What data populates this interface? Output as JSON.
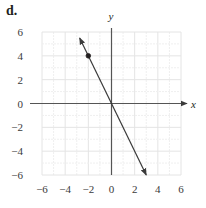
{
  "panel_label": "d.",
  "chart_data": {
    "type": "line",
    "title": "",
    "xlabel": "x",
    "ylabel": "y",
    "xlim": [
      -6,
      6
    ],
    "ylim": [
      -6,
      6
    ],
    "grid": true,
    "grid_minor_step": 1,
    "grid_major_step": 2,
    "x_ticks": [
      -6,
      -4,
      -2,
      0,
      2,
      4,
      6
    ],
    "y_ticks": [
      -6,
      -4,
      -2,
      0,
      2,
      4,
      6
    ],
    "x_tick_labels": [
      "−6",
      "−4",
      "−2",
      "0",
      "2",
      "4",
      "6"
    ],
    "y_tick_labels": [
      "−6",
      "−4",
      "−2",
      "0",
      "2",
      "4",
      "6"
    ],
    "series": [
      {
        "name": "line",
        "equation": "y = -2x",
        "slope": -2,
        "intercept": 0,
        "x_range": [
          -2.75,
          3.0
        ],
        "arrows": "both",
        "color": "#3a3a3a"
      }
    ],
    "points": [
      {
        "x": -2,
        "y": 4,
        "filled": true
      }
    ],
    "colors": {
      "axis": "#555555",
      "grid_major": "#e4e4e4",
      "grid_minor": "#efefef",
      "text": "#3a3a3a"
    }
  }
}
